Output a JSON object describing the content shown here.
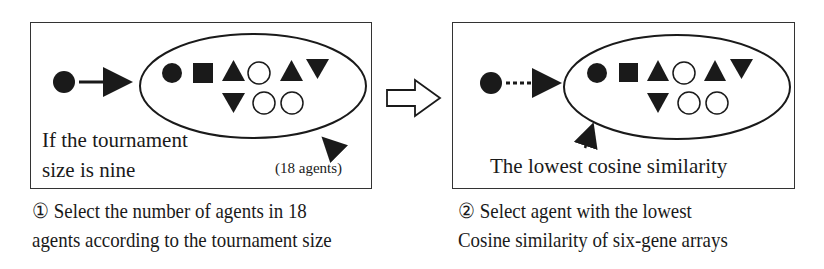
{
  "step1": {
    "box_text_line1": "If the tournament",
    "box_text_line2": "size is nine",
    "group_label": "(18 agents)",
    "arrow_style": "solid",
    "caption_number": "①",
    "caption_line1": "Select the number of agents in 18",
    "caption_line2": "agents according  to the tournament size"
  },
  "step2": {
    "box_text": "The lowest cosine similarity",
    "arrow_style": "dotted",
    "caption_number": "②",
    "caption_line1": "Select agent with the lowest",
    "caption_line2": "Cosine similarity of six-gene arrays"
  },
  "agents_row1": [
    "filled-circle",
    "filled-square",
    "filled-triangle-up",
    "hollow-circle",
    "filled-triangle-up",
    "filled-triangle-down"
  ],
  "agents_row2": [
    "filled-triangle-down",
    "hollow-circle",
    "hollow-circle"
  ],
  "transition_icon": "hollow-right-arrow",
  "colors": {
    "ink": "#1a1a1a",
    "background": "#ffffff"
  }
}
